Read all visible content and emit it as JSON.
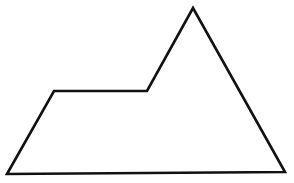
{
  "diagram": {
    "shape": "pentagon",
    "vertex_count": 5,
    "fill": "none",
    "stroke_color": "#111111",
    "background_color": "#ffffff",
    "labels": []
  }
}
